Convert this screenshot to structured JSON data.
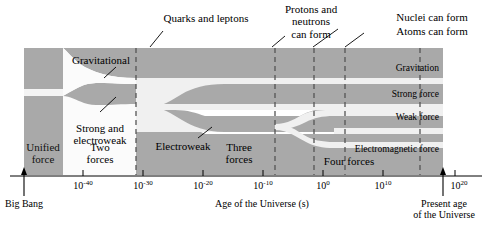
{
  "figure": {
    "type": "timeline-diagram"
  },
  "axis": {
    "title": "Age of the Universe (s)",
    "ticks": [
      {
        "label_base": "10",
        "label_exp": "-40",
        "x": 83
      },
      {
        "label_base": "10",
        "label_exp": "-30",
        "x": 143
      },
      {
        "label_base": "10",
        "label_exp": "-20",
        "x": 203
      },
      {
        "label_base": "10",
        "label_exp": "-10",
        "x": 263
      },
      {
        "label_base": "10",
        "label_exp": "0",
        "x": 323
      },
      {
        "label_base": "10",
        "label_exp": "10",
        "x": 383
      },
      {
        "label_base": "10",
        "label_exp": "20",
        "x": 443
      }
    ],
    "start_marker": {
      "label_line1": "Big Bang",
      "x": 24
    },
    "end_marker": {
      "label_line1": "Present age",
      "label_line2": "of the Universe",
      "x": 443
    }
  },
  "callouts": [
    {
      "name": "quarks-and-leptons",
      "text": "Quarks and leptons",
      "x": 206,
      "y": 12
    },
    {
      "name": "protons-and-neutrons",
      "text_line1": "Protons and",
      "text_line2": "neutrons",
      "text_line3": "can form",
      "x": 311,
      "y": 3
    },
    {
      "name": "nuclei-can-form",
      "text": "Nuclei can form",
      "x": 432,
      "y": 12
    },
    {
      "name": "atoms-can-form",
      "text": "Atoms can form",
      "x": 432,
      "y": 26
    }
  ],
  "era_labels": [
    {
      "name": "unified-force",
      "line1": "Unified",
      "line2": "force",
      "x": 43,
      "y": 144
    },
    {
      "name": "two-forces",
      "line1": "Two",
      "line2": "forces",
      "x": 100,
      "y": 144
    },
    {
      "name": "three-forces",
      "line1": "Three",
      "line2": "forces",
      "x": 236,
      "y": 144
    },
    {
      "name": "four-forces",
      "text": "Four forces",
      "x": 339,
      "y": 158
    }
  ],
  "branch_labels": [
    {
      "name": "gravitational",
      "text": "Gravitational",
      "x": 73,
      "y": 58
    },
    {
      "name": "strong-and-electroweak",
      "line1": "Strong and",
      "line2": "electroweak",
      "x": 70,
      "y": 126
    },
    {
      "name": "electroweak",
      "text": "Electroweak",
      "x": 152,
      "y": 146
    }
  ],
  "force_labels": [
    {
      "name": "gravitation",
      "text": "Gravitation",
      "y": 66
    },
    {
      "name": "strong-force",
      "text": "Strong force",
      "y": 92
    },
    {
      "name": "weak-force",
      "text": "Weak force",
      "y": 115
    },
    {
      "name": "electromagnetic-force",
      "text": "Electromagnetic force",
      "y": 148
    }
  ],
  "colors": {
    "band_dark": "#a9a9a9",
    "band_light": "#d0d0d0",
    "background": "#ffffff",
    "gap": "#f2f2f2",
    "axis": "#000000",
    "dashed": "#555555"
  },
  "dashed_lines_x": [
    136,
    275,
    314,
    345,
    420
  ]
}
